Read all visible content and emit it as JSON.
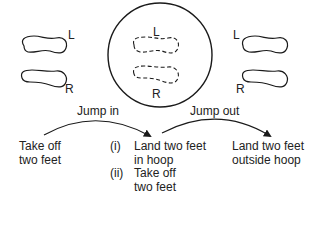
{
  "diagram": {
    "type": "jump-sequence",
    "left_feet": {
      "left_label": "L",
      "right_label": "R"
    },
    "hoop": {
      "left_label": "L",
      "right_label": "R"
    },
    "right_feet": {
      "left_label": "L",
      "right_label": "R"
    },
    "arrows": {
      "jump_in": "Jump in",
      "jump_out": "Jump out"
    },
    "start": {
      "line1": "Take off",
      "line2": "two feet"
    },
    "middle_steps": [
      {
        "num": "(i)",
        "line1": "Land two feet",
        "line2": "in hoop"
      },
      {
        "num": "(ii)",
        "line1": "Take off",
        "line2": "two feet"
      }
    ],
    "end": {
      "line1": "Land two feet",
      "line2": "outside hoop"
    },
    "colors": {
      "stroke": "#1a1a1a",
      "background": "#ffffff"
    }
  }
}
